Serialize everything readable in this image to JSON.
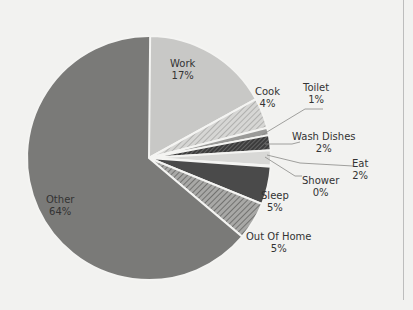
{
  "chart_data": {
    "type": "pie",
    "title": "",
    "start_angle_deg": -90,
    "direction": "clockwise",
    "categories": [
      "Work",
      "Cook",
      "Toilet",
      "Wash Dishes",
      "Eat",
      "Shower",
      "Sleep",
      "Out Of Home",
      "Other"
    ],
    "values": [
      17,
      4,
      1,
      2,
      2,
      0,
      5,
      5,
      64
    ],
    "labels": [
      "17%",
      "4%",
      "1%",
      "2%",
      "2%",
      "0%",
      "5%",
      "5%",
      "64%"
    ],
    "fills": [
      "#c8c8c6",
      "hatch-light",
      "#9a9a98",
      "hatch-dark",
      "#d8d8d6",
      "#bcbcba",
      "#4a4a4a",
      "hatch-mid",
      "#7a7a78"
    ],
    "legend": "none (data labels on slices with leader lines)"
  },
  "labels": {
    "work": {
      "name": "Work",
      "pct": "17%"
    },
    "cook": {
      "name": "Cook",
      "pct": "4%"
    },
    "toilet": {
      "name": "Toilet",
      "pct": "1%"
    },
    "wash": {
      "name": "Wash Dishes",
      "pct": "2%"
    },
    "eat": {
      "name": "Eat",
      "pct": "2%"
    },
    "shower": {
      "name": "Shower",
      "pct": "0%"
    },
    "sleep": {
      "name": "Sleep",
      "pct": "5%"
    },
    "outofhome": {
      "name": "Out Of Home",
      "pct": "5%"
    },
    "other": {
      "name": "Other",
      "pct": "64%"
    }
  }
}
